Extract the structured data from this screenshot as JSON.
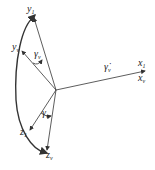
{
  "diagram": {
    "type": "rotation-angle-diagram",
    "labels": {
      "y1": {
        "base": "y",
        "sub": "1"
      },
      "yv": {
        "base": "y",
        "sub": "v"
      },
      "z1": {
        "base": "z",
        "sub": "1"
      },
      "zv": {
        "base": "z",
        "sub": "v"
      },
      "x1": {
        "base": "x",
        "sub": "1"
      },
      "xv": {
        "base": "x",
        "sub": "v"
      },
      "gamma_top": {
        "base": "γ",
        "sub": "v"
      },
      "gamma_bottom": {
        "base": "γ",
        "sub": "v"
      },
      "gamma_dot": {
        "base": "γ̇",
        "sub": "v"
      }
    },
    "stroke_color": "#333333",
    "background": "#ffffff"
  }
}
